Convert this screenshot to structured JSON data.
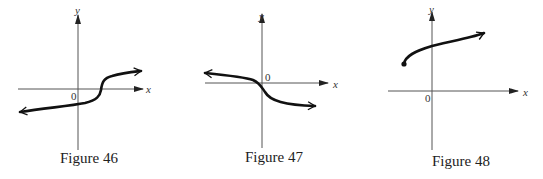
{
  "figures": [
    {
      "caption": "Figure 46",
      "x_label": "x",
      "y_label": "y",
      "origin_label": "0",
      "description": "Increasing curve with a vertical-tangent inflection to the right of the y-axis; arrows on both ends"
    },
    {
      "caption": "Figure 47",
      "x_label": "x",
      "y_label": "y",
      "origin_label": "0",
      "description": "Decreasing curve with a vertical-tangent inflection at the origin; arrows on both ends"
    },
    {
      "caption": "Figure 48",
      "x_label": "x",
      "y_label": "y",
      "origin_label": "0",
      "description": "Increasing square-root-like curve starting at a closed endpoint left of the y-axis; arrow at right end"
    }
  ]
}
